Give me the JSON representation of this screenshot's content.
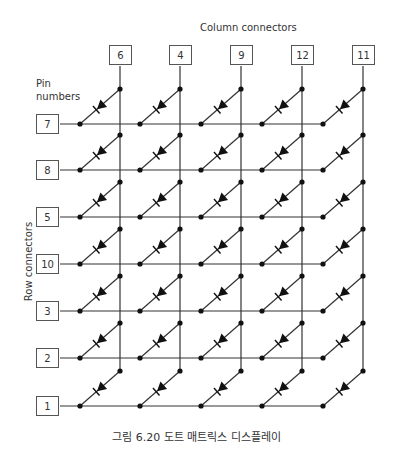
{
  "labels": {
    "column_connectors": "Column connectors",
    "pin_numbers_line1": "Pin",
    "pin_numbers_line2": "numbers",
    "row_connectors": "Row connectors"
  },
  "columns": [
    {
      "pin": "6",
      "x": 120
    },
    {
      "pin": "4",
      "x": 180
    },
    {
      "pin": "9",
      "x": 241
    },
    {
      "pin": "12",
      "x": 302
    },
    {
      "pin": "11",
      "x": 363
    }
  ],
  "rows": [
    {
      "pin": "7",
      "y": 124
    },
    {
      "pin": "8",
      "y": 170
    },
    {
      "pin": "5",
      "y": 217
    },
    {
      "pin": "10",
      "y": 264
    },
    {
      "pin": "3",
      "y": 311
    },
    {
      "pin": "2",
      "y": 358
    },
    {
      "pin": "1",
      "y": 406
    }
  ],
  "caption": "그림 6.20 도트 매트릭스 디스플레이",
  "colors": {
    "line": "#333333",
    "box_border": "#555555",
    "text": "#333333"
  }
}
